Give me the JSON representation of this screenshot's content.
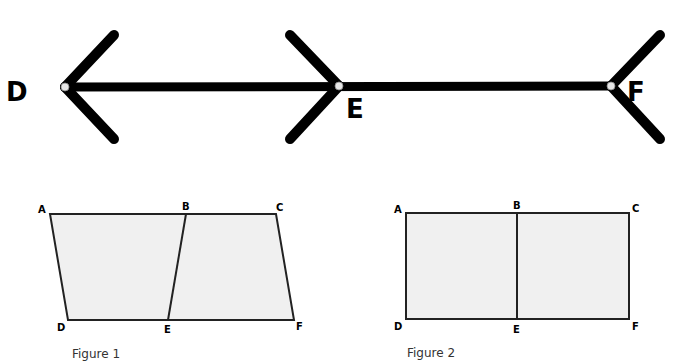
{
  "illusion": {
    "points": [
      {
        "label": "D",
        "x": 65,
        "y": 87,
        "lx": 6,
        "ly": 101
      },
      {
        "label": "E",
        "x": 339,
        "y": 86,
        "lx": 346,
        "ly": 118
      },
      {
        "label": "F",
        "x": 611,
        "y": 86,
        "lx": 627,
        "ly": 101
      }
    ],
    "segments": [
      [
        65,
        87,
        611,
        86
      ],
      [
        65,
        87,
        114,
        35
      ],
      [
        65,
        87,
        114,
        139
      ],
      [
        339,
        86,
        290,
        35
      ],
      [
        339,
        86,
        290,
        139
      ],
      [
        611,
        86,
        660,
        35
      ],
      [
        611,
        86,
        660,
        139
      ]
    ],
    "line_color": "#000000",
    "point_fill": "#e6e6e6"
  },
  "figure1": {
    "caption": "Figure 1",
    "caption_pos": [
      72,
      358
    ],
    "fill": "#f0f0f0",
    "stroke": "#222222",
    "vertices": {
      "A": [
        50,
        214
      ],
      "B": [
        186,
        214
      ],
      "C": [
        276,
        214
      ],
      "D": [
        68,
        320
      ],
      "E": [
        168,
        320
      ],
      "F": [
        294,
        320
      ]
    },
    "labels": [
      {
        "text": "A",
        "x": 38,
        "y": 213
      },
      {
        "text": "B",
        "x": 182,
        "y": 210
      },
      {
        "text": "C",
        "x": 276,
        "y": 211
      },
      {
        "text": "D",
        "x": 57,
        "y": 331
      },
      {
        "text": "E",
        "x": 164,
        "y": 333
      },
      {
        "text": "F",
        "x": 296,
        "y": 330
      }
    ]
  },
  "figure2": {
    "caption": "Figure 2",
    "caption_pos": [
      407,
      357
    ],
    "fill": "#f0f0f0",
    "stroke": "#222222",
    "vertices": {
      "A": [
        406,
        213
      ],
      "B": [
        517,
        213
      ],
      "C": [
        629,
        213
      ],
      "D": [
        406,
        319
      ],
      "E": [
        517,
        319
      ],
      "F": [
        629,
        319
      ]
    },
    "labels": [
      {
        "text": "A",
        "x": 394,
        "y": 213
      },
      {
        "text": "B",
        "x": 513,
        "y": 209
      },
      {
        "text": "C",
        "x": 632,
        "y": 212
      },
      {
        "text": "D",
        "x": 394,
        "y": 330
      },
      {
        "text": "E",
        "x": 513,
        "y": 333
      },
      {
        "text": "F",
        "x": 632,
        "y": 330
      }
    ]
  }
}
